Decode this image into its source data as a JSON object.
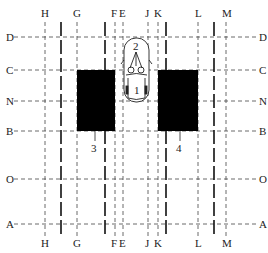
{
  "diagram": {
    "vertical_lines": [
      {
        "label": "H",
        "x": 45,
        "style": "thin"
      },
      {
        "label": "",
        "x": 61,
        "style": "thick"
      },
      {
        "label": "G",
        "x": 77,
        "style": "thin"
      },
      {
        "label": "",
        "x": 105,
        "style": "thick"
      },
      {
        "label": "F",
        "x": 115,
        "style": "thin"
      },
      {
        "label": "E",
        "x": 123,
        "style": "thin"
      },
      {
        "label": "J",
        "x": 148,
        "style": "thin"
      },
      {
        "label": "K",
        "x": 158,
        "style": "thin"
      },
      {
        "label": "",
        "x": 166,
        "style": "thick"
      },
      {
        "label": "L",
        "x": 198,
        "style": "thin"
      },
      {
        "label": "",
        "x": 214,
        "style": "thick"
      },
      {
        "label": "M",
        "x": 226,
        "style": "thin"
      }
    ],
    "horizontal_lines": [
      {
        "label": "D",
        "y": 37
      },
      {
        "label": "C",
        "y": 70
      },
      {
        "label": "N",
        "y": 101
      },
      {
        "label": "B",
        "y": 131
      },
      {
        "label": "O",
        "y": 179
      },
      {
        "label": "A",
        "y": 224
      }
    ],
    "blocks": [
      {
        "label": "3",
        "x": 77,
        "y": 70,
        "w": 38,
        "h": 61
      },
      {
        "label": "4",
        "x": 158,
        "y": 70,
        "w": 40,
        "h": 61
      }
    ],
    "car": {
      "label_front": "2",
      "label_rear": "1"
    },
    "colors": {
      "line": "#333333",
      "block": "#000000"
    }
  }
}
